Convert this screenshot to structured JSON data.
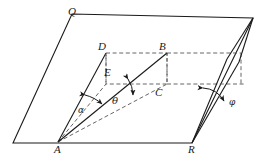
{
  "figure": {
    "type": "geometry-diagram",
    "background_color": "#ffffff",
    "line_color": "#1a1a1a",
    "labels": {
      "Q": "Q",
      "A": "A",
      "R": "R",
      "D": "D",
      "B": "B",
      "E": "E",
      "C": "C",
      "alpha": "α",
      "theta": "θ",
      "phi": "φ"
    },
    "label_positions": {
      "Q": {
        "x": 68,
        "y": 8
      },
      "A": {
        "x": 54,
        "y": 145
      },
      "R": {
        "x": 188,
        "y": 145
      },
      "D": {
        "x": 99,
        "y": 43
      },
      "B": {
        "x": 160,
        "y": 43
      },
      "E": {
        "x": 104,
        "y": 69
      },
      "C": {
        "x": 156,
        "y": 89
      },
      "alpha": {
        "x": 78,
        "y": 107
      },
      "theta": {
        "x": 113,
        "y": 99
      },
      "phi": {
        "x": 230,
        "y": 100
      }
    },
    "ground_plane": {
      "name": "large-parallelogram",
      "points": "13,143 72,14 253,18 192,143"
    },
    "dashed_rectangle": {
      "name": "rectangle-DBCE",
      "points": "106,53 167,53 167,84 106,84"
    },
    "solid_lines": [
      {
        "name": "line-A-D",
        "x1": 58,
        "y1": 142,
        "x2": 106,
        "y2": 53
      },
      {
        "name": "line-A-B",
        "x1": 58,
        "y1": 142,
        "x2": 167,
        "y2": 53
      },
      {
        "name": "line-D-E-vertical",
        "x1": 106,
        "y1": 53,
        "x2": 106,
        "y2": 84
      },
      {
        "name": "line-B-C-vertical",
        "x1": 167,
        "y1": 53,
        "x2": 167,
        "y2": 84
      },
      {
        "name": "wedge-left-edge",
        "x1": 192,
        "y1": 143,
        "x2": 228,
        "y2": 60
      },
      {
        "name": "wedge-right-edge",
        "x1": 192,
        "y1": 143,
        "x2": 238,
        "y2": 62
      },
      {
        "name": "wedge-top-riser",
        "x1": 228,
        "y1": 60,
        "x2": 253,
        "y2": 18
      },
      {
        "name": "wedge-right-riser",
        "x1": 238,
        "y1": 62,
        "x2": 253,
        "y2": 18
      }
    ],
    "dashed_lines": [
      {
        "name": "line-A-E-dashed",
        "x1": 58,
        "y1": 142,
        "x2": 106,
        "y2": 84
      },
      {
        "name": "line-A-C-dashed",
        "x1": 58,
        "y1": 142,
        "x2": 167,
        "y2": 84
      },
      {
        "name": "line-B-right-dashed",
        "x1": 167,
        "y1": 53,
        "x2": 240,
        "y2": 53
      },
      {
        "name": "line-C-right-dashed",
        "x1": 167,
        "y1": 84,
        "x2": 245,
        "y2": 84
      },
      {
        "name": "line-right-vertical-dashed",
        "x1": 240,
        "y1": 53,
        "x2": 240,
        "y2": 84
      }
    ],
    "angle_arcs": [
      {
        "name": "arc-alpha",
        "cx": 58,
        "cy": 142,
        "radius": 62,
        "from_deg": 241,
        "to_deg": 230
      },
      {
        "name": "arc-theta",
        "cx": 58,
        "cy": 142,
        "radius": 88,
        "from_deg": 219,
        "to_deg": 207
      },
      {
        "name": "arc-phi",
        "cx": 192,
        "cy": 143,
        "radius": 84,
        "from_deg": 292,
        "to_deg": 285
      }
    ]
  }
}
